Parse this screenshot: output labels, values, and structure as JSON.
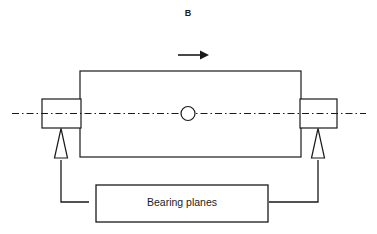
{
  "figure": {
    "kind": "engineering-diagram",
    "background_color": "#ffffff",
    "line_color": "#1a1a1a"
  },
  "annotations": {
    "section_label": "B",
    "bearing_planes_label": "Bearing planes"
  },
  "icons": {
    "direction_arrow": "arrow-right-icon",
    "axis": "centerline-dash-dot",
    "support_left": "triangle-support-icon",
    "support_right": "triangle-support-icon",
    "center_mark": "circle-mark-icon"
  },
  "geometry": {
    "rotor_body": {
      "x": 80,
      "y": 71,
      "width": 221,
      "height": 86
    },
    "journal_left": {
      "x": 42,
      "y": 99,
      "width": 38,
      "height": 29
    },
    "journal_right": {
      "x": 301,
      "y": 99,
      "width": 36,
      "height": 29
    },
    "centerline": {
      "x1": 12,
      "x2": 366,
      "y": 113
    },
    "center_circle": {
      "cx": 188,
      "cy": 114,
      "r": 7
    },
    "support_left": {
      "apex_x": 61,
      "apex_y": 128,
      "base_y": 158,
      "half_width": 6
    },
    "support_right": {
      "apex_x": 318,
      "apex_y": 128,
      "base_y": 158,
      "half_width": 6
    },
    "label_box": {
      "x": 96,
      "y": 185,
      "width": 172,
      "height": 37
    },
    "arrow": {
      "x1": 178,
      "x2": 208,
      "y": 55
    },
    "leader_left": {
      "from_x": 61,
      "from_y": 160,
      "corner_y": 202,
      "to_x": 89
    },
    "leader_right": {
      "from_x": 318,
      "from_y": 160,
      "corner_y": 202,
      "to_x": 269
    }
  }
}
